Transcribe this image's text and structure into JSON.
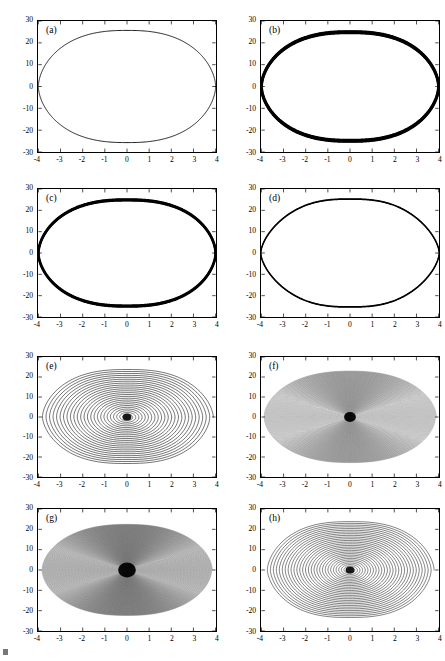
{
  "figure": {
    "type": "multi-panel-phase-portrait-figure",
    "panel_count": 8,
    "grid": "2 columns x 4 rows",
    "background_color": "#ffffff",
    "line_color": "#000000",
    "axis_color": "#000000"
  },
  "axes_common": {
    "xlabel": "",
    "ylabel": "",
    "xlim": [
      -4,
      4
    ],
    "ylim": [
      -30,
      30
    ],
    "xticks": [
      -4,
      -3,
      -2,
      -1,
      0,
      1,
      2,
      3,
      4
    ],
    "xticklabels": [
      "-4",
      "-3",
      "-2",
      "-1",
      "0",
      "1",
      "2",
      "3",
      "4"
    ],
    "yticks": [
      30,
      20,
      10,
      0,
      -10,
      -20,
      -30
    ],
    "yticklabels": [
      "30",
      "20",
      "10",
      "0",
      "-10",
      "-20",
      "-30"
    ],
    "grid": "off",
    "legend": "none",
    "box": "on",
    "tick_direction": "in"
  },
  "chart_data": [
    {
      "id": "a",
      "type": "line",
      "title": "(a)",
      "label": "(a)",
      "xlabel": "",
      "ylabel": "",
      "xlim": [
        -4,
        4
      ],
      "ylim": [
        -30,
        30
      ],
      "grid": "off",
      "legend": "none",
      "orbit": "closed-limit-cycle",
      "turns": 1,
      "line_width": 0.9,
      "density": "thin",
      "x_amplitude": 4.0,
      "y_amplitude": 25.8,
      "center": [
        0,
        0
      ],
      "shape": "lens-shaped closed curve, pointed at left and right extremes, flat-topped near x=0",
      "description": "Single thin closed periodic orbit spanning x from -4 to 4 and y from -25.8 to 25.8"
    },
    {
      "id": "b",
      "type": "line",
      "title": "(b)",
      "label": "(b)",
      "xlabel": "",
      "ylabel": "",
      "xlim": [
        -4,
        4
      ],
      "ylim": [
        -30,
        30
      ],
      "grid": "off",
      "legend": "none",
      "orbit": "closed-limit-cycle-thick",
      "turns": 6,
      "line_width": 1.9,
      "density": "thick",
      "x_amplitude": 4.0,
      "y_amplitude": 25.0,
      "center": [
        0,
        0
      ],
      "shape": "lens-shaped closed curve drawn with several nearly coincident overlapping passes making a bold outline",
      "description": "Closed orbit traced repeatedly so the curve appears bold/thick; spans x -4 to 4, y -25 to 25"
    },
    {
      "id": "c",
      "type": "line",
      "title": "(c)",
      "label": "(c)",
      "xlabel": "",
      "ylabel": "",
      "xlim": [
        -4,
        4
      ],
      "ylim": [
        -30,
        30
      ],
      "grid": "off",
      "legend": "none",
      "orbit": "closed-limit-cycle-thick",
      "turns": 5,
      "line_width": 1.7,
      "density": "thick",
      "x_amplitude": 4.0,
      "y_amplitude": 25.0,
      "center": [
        0,
        0
      ],
      "shape": "lens-shaped closed curve, bold outline from multiple overlapping passes",
      "description": "Closed orbit similar to (b), slightly rounder; spans x -4 to 4, y -25 to 25"
    },
    {
      "id": "d",
      "type": "line",
      "title": "(d)",
      "label": "(d)",
      "xlabel": "",
      "ylabel": "",
      "xlim": [
        -4,
        4
      ],
      "ylim": [
        -30,
        30
      ],
      "grid": "off",
      "legend": "none",
      "orbit": "closed-limit-cycle",
      "turns": 2,
      "line_width": 1.3,
      "density": "medium",
      "x_amplitude": 3.95,
      "y_amplitude": 24.3,
      "center": [
        0,
        0
      ],
      "shape": "rounded-rectangular closed curve with flattened top and bottom",
      "description": "Closed orbit with flatter top/bottom plateaus; spans x -3.95 to 3.95, y -24.3 to 24.3"
    },
    {
      "id": "e",
      "type": "line",
      "title": "(e)",
      "label": "(e)",
      "xlabel": "",
      "ylabel": "",
      "xlim": [
        -4,
        4
      ],
      "ylim": [
        -30,
        30
      ],
      "grid": "off",
      "legend": "none",
      "orbit": "inward-spiral",
      "turns": 26,
      "line_width": 0.55,
      "density": "sparse",
      "x_amplitude": 3.9,
      "y_amplitude": 24.0,
      "center": [
        0,
        0
      ],
      "focus": "stable focus at origin",
      "shape": "slowly decaying diamond/lens shaped spiral with clearly separated turns, dark dense blot at the origin",
      "description": "Trajectory spirals inward from near x=+/-3.9, y=+/-24 toward a stable focus at the origin; individual windings remain visibly separated"
    },
    {
      "id": "f",
      "type": "line",
      "title": "(f)",
      "label": "(f)",
      "xlabel": "",
      "ylabel": "",
      "xlim": [
        -4,
        4
      ],
      "ylim": [
        -30,
        30
      ],
      "grid": "off",
      "legend": "none",
      "orbit": "inward-spiral",
      "turns": 95,
      "line_width": 0.4,
      "density": "dense",
      "x_amplitude": 3.9,
      "y_amplitude": 23.0,
      "center": [
        0,
        0
      ],
      "focus": "stable focus at origin",
      "shape": "dense elliptical spiral with many tightly packed windings forming a grey textured disc",
      "description": "Slowly decaying spiral with a very large number of windings that blend into a grey filled ellipse; dark blot at the origin"
    },
    {
      "id": "g",
      "type": "line",
      "title": "(g)",
      "label": "(g)",
      "xlabel": "",
      "ylabel": "",
      "xlim": [
        -4,
        4
      ],
      "ylim": [
        -30,
        30
      ],
      "grid": "off",
      "legend": "none",
      "orbit": "inward-spiral",
      "turns": 150,
      "line_width": 0.4,
      "density": "very-dense",
      "x_amplitude": 3.85,
      "y_amplitude": 22.5,
      "center": [
        0,
        0
      ],
      "focus": "stable focus at origin",
      "shape": "very dense elliptical spiral, nearly solid dark grey disc with a black core at the origin",
      "description": "Densest spiral of the set; windings overlap into a nearly filled ellipse with a pronounced black core"
    },
    {
      "id": "h",
      "type": "line",
      "title": "(h)",
      "label": "(h)",
      "xlabel": "",
      "ylabel": "",
      "xlim": [
        -4,
        4
      ],
      "ylim": [
        -30,
        30
      ],
      "grid": "off",
      "legend": "none",
      "orbit": "inward-spiral",
      "turns": 30,
      "line_width": 0.5,
      "density": "sparse",
      "x_amplitude": 3.8,
      "y_amplitude": 24.0,
      "center": [
        0,
        0
      ],
      "focus": "stable focus at origin",
      "shape": "decaying diamond/lens shaped spiral with separated windings and a dark dense core",
      "description": "Trajectory spirals inward toward a stable focus at the origin; windings clearly resolved, similar to (e)"
    }
  ],
  "panels": [
    {
      "label": "(a)"
    },
    {
      "label": "(b)"
    },
    {
      "label": "(c)"
    },
    {
      "label": "(d)"
    },
    {
      "label": "(e)"
    },
    {
      "label": "(f)"
    },
    {
      "label": "(g)"
    },
    {
      "label": "(h)"
    }
  ]
}
